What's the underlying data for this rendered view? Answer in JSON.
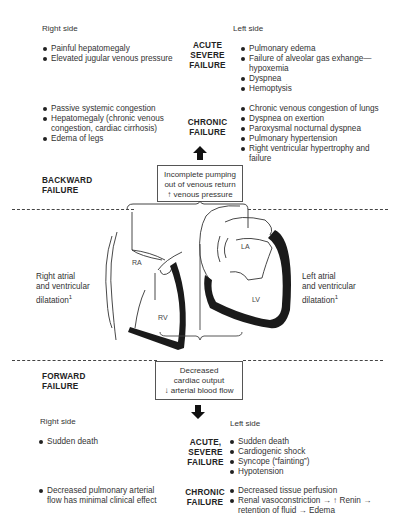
{
  "backward": {
    "label": "BACKWARD\nFAILURE",
    "label_line1": "BACKWARD",
    "label_line2": "FAILURE",
    "box": [
      "Incomplete pumping",
      "out of venous return",
      "↑ venous pressure"
    ],
    "right_header": "Right side",
    "left_header": "Left side",
    "acute": {
      "label": [
        "ACUTE",
        "SEVERE",
        "FAILURE"
      ],
      "right": [
        "Painful hepatomegaly",
        "Elevated jugular venous pressure"
      ],
      "left": [
        "Pulmonary edema",
        "Failure of alveolar gas exhange—hypoxemia",
        "Dyspnea",
        "Hemoptysis"
      ]
    },
    "chronic": {
      "label": [
        "CHRONIC",
        "FAILURE"
      ],
      "right": [
        "Passive systemic congestion",
        "Hepatomegaly (chronic venous congestion, cardiac cirrhosis)",
        "Edema of legs"
      ],
      "left": [
        "Chronic venous congestion of lungs",
        "Dyspnea on exertion",
        "Paroxysmal nocturnal dyspnea",
        "Pulmonary hypertension",
        "Right ventricular hypertrophy and failure"
      ]
    }
  },
  "heart": {
    "right_caption": [
      "Right atrial",
      "and ventricular",
      "dilatation"
    ],
    "left_caption": [
      "Left atrial",
      "and ventricular",
      "dilatation"
    ],
    "footnote_mark": "1",
    "labels": {
      "ra": "RA",
      "rv": "RV",
      "la": "LA",
      "lv": "LV"
    }
  },
  "forward": {
    "label_line1": "FORWARD",
    "label_line2": "FAILURE",
    "box": [
      "Decreased",
      "cardiac output",
      "↓ arterial blood flow"
    ],
    "right_header": "Right side",
    "left_header": "Left side",
    "acute": {
      "label": [
        "ACUTE,",
        "SEVERE",
        "FAILURE"
      ],
      "right": [
        "Sudden death"
      ],
      "left": [
        "Sudden death",
        "Cardiogenic shock",
        "Syncope (“fainting”)",
        "Hypotension"
      ]
    },
    "chronic": {
      "label": [
        "CHRONIC",
        "FAILURE"
      ],
      "right": [
        "Decreased pulmonary arterial flow has minimal clinical effect"
      ],
      "left": [
        "Decreased tissue perfusion",
        "Renal vasoconstriction → ↑ Renin → retention of fluid → Edema"
      ]
    }
  }
}
